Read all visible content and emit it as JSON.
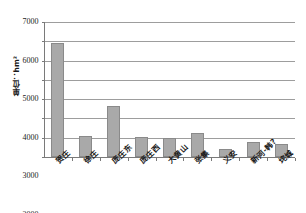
{
  "chart_data": {
    "type": "bar",
    "title": "",
    "xlabel": "",
    "ylabel": "单位：hm²",
    "ylim": [
      0,
      7000
    ],
    "ytick_step": 1000,
    "yticks": [
      "0",
      "1000",
      "2000",
      "3000",
      "4000",
      "5000",
      "6000",
      "7000"
    ],
    "grid": "horizontal",
    "legend": "none",
    "bar_color": "#a9a9a9",
    "bar_edge_color": "#8a8a8a",
    "gridline_color": "#9d9d9d",
    "axis_color": "#7a7a7a",
    "categories": [
      "贺庄",
      "徐庄",
      "庞庄东",
      "庞庄西",
      "大黄山",
      "张集",
      "义安",
      "新河-韩?",
      "垞城"
    ],
    "category_lines": [
      [
        "贺庄"
      ],
      [
        "徐庄"
      ],
      [
        "庞庄东"
      ],
      [
        "庞庄西"
      ],
      [
        "大黄山"
      ],
      [
        "张集"
      ],
      [
        "义安"
      ],
      [
        "新河-韩?"
      ],
      [
        "垞城"
      ]
    ],
    "values": [
      5900,
      1100,
      2650,
      1050,
      970,
      1250,
      430,
      780,
      700
    ]
  }
}
